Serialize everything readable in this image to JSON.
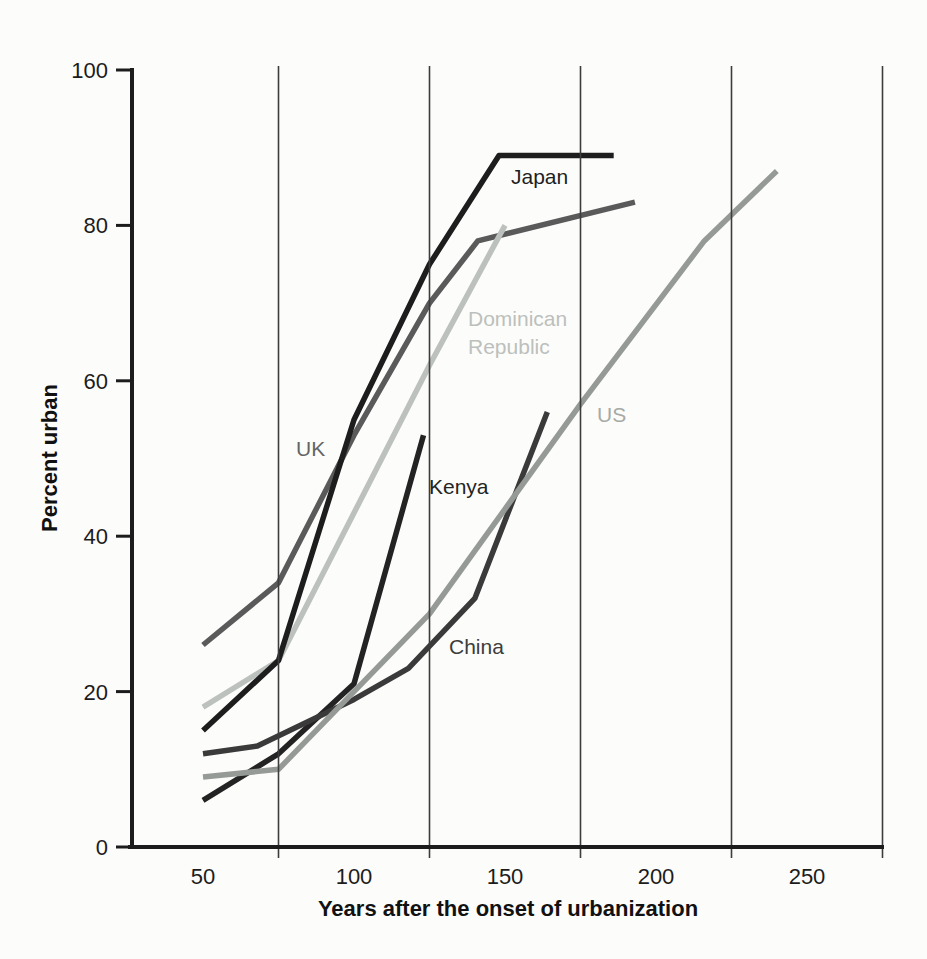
{
  "figure": {
    "background": "#fcfcfa"
  },
  "chart_data": {
    "type": "line",
    "title": "",
    "xlabel": "Years after the onset of urbanization",
    "ylabel": "Percent urban",
    "xlim": [
      28,
      275
    ],
    "ylim": [
      0,
      100
    ],
    "x_ticks": [
      50,
      100,
      150,
      200,
      250
    ],
    "y_ticks": [
      0,
      20,
      40,
      60,
      80,
      100
    ],
    "x_gridlines": [
      75,
      125,
      175,
      225,
      275
    ],
    "grid_on": true,
    "legend_position": "inline-labels",
    "axis_color": "#1c1c1c",
    "grid_color": "#3c3c3c",
    "series": [
      {
        "name": "UK",
        "label": "UK",
        "color": "#5a5a5a",
        "label_color": "#646464",
        "label_px": [
          296,
          456
        ],
        "points": [
          [
            50,
            26
          ],
          [
            75,
            34
          ],
          [
            100,
            53
          ],
          [
            125,
            70
          ],
          [
            141,
            78
          ],
          [
            193,
            83
          ]
        ]
      },
      {
        "name": "Dominican Republic",
        "label": "Dominican\nRepublic",
        "color": "#bdc1bd",
        "label_color": "#bcc0bc",
        "label_px": [
          468,
          326
        ],
        "points": [
          [
            50,
            18
          ],
          [
            75,
            24
          ],
          [
            125,
            62
          ],
          [
            150,
            80
          ]
        ]
      },
      {
        "name": "Kenya",
        "label": "Kenya",
        "color": "#232323",
        "label_color": "#242424",
        "label_px": [
          429,
          494
        ],
        "points": [
          [
            50,
            6
          ],
          [
            75,
            12
          ],
          [
            100,
            21
          ],
          [
            123,
            53
          ]
        ]
      },
      {
        "name": "China",
        "label": "China",
        "color": "#3a3a3a",
        "label_color": "#3c3c3c",
        "label_px": [
          449,
          654
        ],
        "points": [
          [
            50,
            12
          ],
          [
            68,
            13
          ],
          [
            100,
            19
          ],
          [
            118,
            23
          ],
          [
            140,
            32
          ],
          [
            164,
            56
          ]
        ]
      },
      {
        "name": "US",
        "label": "US",
        "color": "#969a96",
        "label_color": "#a6aaa6",
        "label_px": [
          597,
          422
        ],
        "points": [
          [
            50,
            9
          ],
          [
            75,
            10
          ],
          [
            125,
            30
          ],
          [
            175,
            57
          ],
          [
            216,
            78
          ],
          [
            240,
            87
          ]
        ]
      },
      {
        "name": "Japan",
        "label": "Japan",
        "color": "#1d1d1d",
        "label_color": "#1f1f1f",
        "label_px": [
          511,
          184
        ],
        "points": [
          [
            50,
            15
          ],
          [
            75,
            24
          ],
          [
            100,
            55
          ],
          [
            125,
            75
          ],
          [
            148,
            89
          ],
          [
            186,
            89
          ]
        ]
      }
    ]
  }
}
